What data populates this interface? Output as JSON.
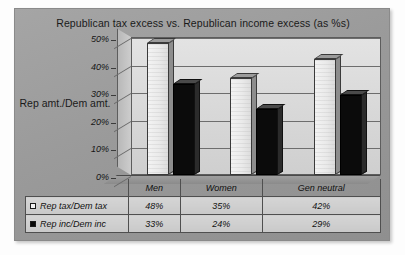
{
  "chart_data": {
    "type": "bar",
    "title": "Republican tax excess vs. Republican income excess (as %s)",
    "xlabel": "",
    "ylabel": "Rep amt./Dem amt.",
    "categories": [
      "Men",
      "Women",
      "Gen neutral"
    ],
    "series": [
      {
        "name": "Rep tax/Dem tax",
        "values": [
          48,
          35,
          42
        ],
        "value_labels": [
          "48%",
          "35%",
          "42%"
        ],
        "marker": "hollow-square",
        "color": "#eaeaea"
      },
      {
        "name": "Rep inc/Dem inc",
        "values": [
          33,
          24,
          29
        ],
        "value_labels": [
          "33%",
          "24%",
          "29%"
        ],
        "marker": "filled-square",
        "color": "#0b0b0b"
      }
    ],
    "ylim": [
      0,
      50
    ],
    "yticks": [
      50,
      40,
      30,
      20,
      10,
      0
    ],
    "ytick_labels": [
      "50%",
      "40%",
      "30%",
      "20%",
      "10%",
      "0%"
    ],
    "grid": true,
    "legend_position": "data-table-below",
    "three_d": true
  },
  "table": {
    "corner_label": "",
    "column_headers": [
      "Men",
      "Women",
      "Gen neutral"
    ],
    "rows": [
      {
        "series_label": "Rep tax/Dem tax",
        "marker": "hollow-square",
        "cells": [
          "48%",
          "35%",
          "42%"
        ]
      },
      {
        "series_label": "Rep inc/Dem inc",
        "marker": "filled-square",
        "cells": [
          "33%",
          "24%",
          "29%"
        ]
      }
    ]
  },
  "colors": {
    "canvas": "#9a9a9a",
    "wall": "#d8d8d8",
    "series_light": "#eaeaea",
    "series_dark": "#0b0b0b",
    "gridline": "#6d6d6d",
    "text": "#101010"
  }
}
